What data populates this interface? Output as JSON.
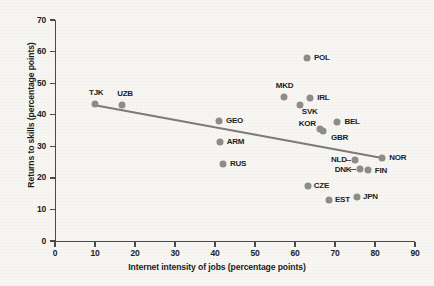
{
  "chart_data": {
    "type": "scatter",
    "title": "",
    "xlabel": "Internet intensity of jobs (percentage points)",
    "ylabel": "Returns to skills (percentage points)",
    "xlim": [
      0,
      90
    ],
    "ylim": [
      0,
      70
    ],
    "xticks": [
      0,
      10,
      20,
      30,
      40,
      50,
      60,
      70,
      80,
      90
    ],
    "yticks": [
      0,
      10,
      20,
      30,
      40,
      50,
      60,
      70
    ],
    "grid": false,
    "legend": "none",
    "marker_color": "#8d8c8a",
    "trendline_color": "#7c7b79",
    "points": [
      {
        "label": "TJK",
        "x": 10.0,
        "y": 43.5,
        "lx": -6,
        "ly": -15
      },
      {
        "label": "UZB",
        "x": 16.8,
        "y": 43.0,
        "lx": -5,
        "ly": -15
      },
      {
        "label": "GEO",
        "x": 41.0,
        "y": 38.0,
        "lx": 7,
        "ly": -4
      },
      {
        "label": "ARM",
        "x": 41.2,
        "y": 31.4,
        "lx": 7,
        "ly": -4
      },
      {
        "label": "RUS",
        "x": 42.0,
        "y": 24.4,
        "lx": 7,
        "ly": -4
      },
      {
        "label": "MKD",
        "x": 57.2,
        "y": 45.6,
        "lx": -8,
        "ly": -15
      },
      {
        "label": "POL",
        "x": 63.0,
        "y": 58.0,
        "lx": 7,
        "ly": -4
      },
      {
        "label": "IRL",
        "x": 63.8,
        "y": 45.3,
        "lx": 7,
        "ly": -4
      },
      {
        "label": "SVK",
        "x": 61.2,
        "y": 43.1,
        "lx": 2,
        "ly": 3
      },
      {
        "label": "KOR",
        "x": 66.2,
        "y": 35.5,
        "lx": -21,
        "ly": -9
      },
      {
        "label": "BEL",
        "x": 70.6,
        "y": 37.7,
        "lx": 7,
        "ly": -4
      },
      {
        "label": "GBR",
        "x": 67.0,
        "y": 34.9,
        "lx": 8,
        "ly": 3
      },
      {
        "label": "NLD",
        "x": 75.0,
        "y": 25.7,
        "lx": -24,
        "ly": -4
      },
      {
        "label": "DNK",
        "x": 76.2,
        "y": 22.8,
        "lx": -25,
        "ly": -3
      },
      {
        "label": "FIN",
        "x": 78.2,
        "y": 22.5,
        "lx": 7,
        "ly": -3
      },
      {
        "label": "NOR",
        "x": 81.8,
        "y": 26.3,
        "lx": 7,
        "ly": -4
      },
      {
        "label": "CZE",
        "x": 63.2,
        "y": 17.4,
        "lx": 6,
        "ly": -4
      },
      {
        "label": "EST",
        "x": 68.5,
        "y": 13.0,
        "lx": 6,
        "ly": -4
      },
      {
        "label": "JPN",
        "x": 75.5,
        "y": 14.0,
        "lx": 6,
        "ly": -4
      }
    ],
    "trendline": {
      "x0": 10.0,
      "y0": 43.0,
      "x1": 81.8,
      "y1": 26.3
    }
  }
}
